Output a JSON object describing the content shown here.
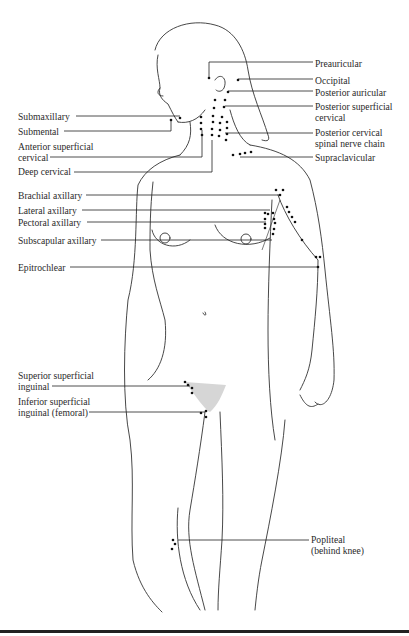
{
  "figure": {
    "labels_left": [
      {
        "id": "submaxillary",
        "text": "Submaxillary",
        "x": 18,
        "y": 111
      },
      {
        "id": "submental",
        "text": "Submental",
        "x": 18,
        "y": 126
      },
      {
        "id": "anterior-superficial-cervical-1",
        "text": "Anterior superficial",
        "x": 18,
        "y": 141
      },
      {
        "id": "anterior-superficial-cervical-2",
        "text": "cervical",
        "x": 18,
        "y": 152
      },
      {
        "id": "deep-cervical",
        "text": "Deep cervical",
        "x": 18,
        "y": 166
      },
      {
        "id": "brachial-axillary",
        "text": "Brachial axillary",
        "x": 18,
        "y": 190
      },
      {
        "id": "lateral-axillary",
        "text": "Lateral axillary",
        "x": 18,
        "y": 205
      },
      {
        "id": "pectoral-axillary",
        "text": "Pectoral axillary",
        "x": 18,
        "y": 217
      },
      {
        "id": "subscapular-axillary",
        "text": "Subscapular axillary",
        "x": 18,
        "y": 235
      },
      {
        "id": "epitrochlear",
        "text": "Epitrochlear",
        "x": 18,
        "y": 262
      },
      {
        "id": "superior-superficial-inguinal-1",
        "text": "Superior superficial",
        "x": 18,
        "y": 370
      },
      {
        "id": "superior-superficial-inguinal-2",
        "text": "inguinal",
        "x": 18,
        "y": 381
      },
      {
        "id": "inferior-superficial-inguinal-1",
        "text": "Inferior superficial",
        "x": 18,
        "y": 396
      },
      {
        "id": "inferior-superficial-inguinal-2",
        "text": "inguinal (femoral)",
        "x": 18,
        "y": 407
      }
    ],
    "labels_right": [
      {
        "id": "preauricular",
        "text": "Preauricular",
        "x": 315,
        "y": 58
      },
      {
        "id": "occipital",
        "text": "Occipital",
        "x": 315,
        "y": 75
      },
      {
        "id": "posterior-auricular",
        "text": "Posterior auricular",
        "x": 315,
        "y": 87
      },
      {
        "id": "posterior-superficial-cervical-1",
        "text": "Posterior superficial",
        "x": 315,
        "y": 101
      },
      {
        "id": "posterior-superficial-cervical-2",
        "text": "cervical",
        "x": 315,
        "y": 112
      },
      {
        "id": "posterior-cervical-spinal-1",
        "text": "Posterior cervical",
        "x": 315,
        "y": 127
      },
      {
        "id": "posterior-cervical-spinal-2",
        "text": "spinal nerve chain",
        "x": 315,
        "y": 138
      },
      {
        "id": "supraclavicular",
        "text": "Supraclavicular",
        "x": 315,
        "y": 152
      },
      {
        "id": "popliteal-1",
        "text": "Popliteal",
        "x": 311,
        "y": 534
      },
      {
        "id": "popliteal-2",
        "text": "(behind knee)",
        "x": 311,
        "y": 545
      }
    ]
  }
}
